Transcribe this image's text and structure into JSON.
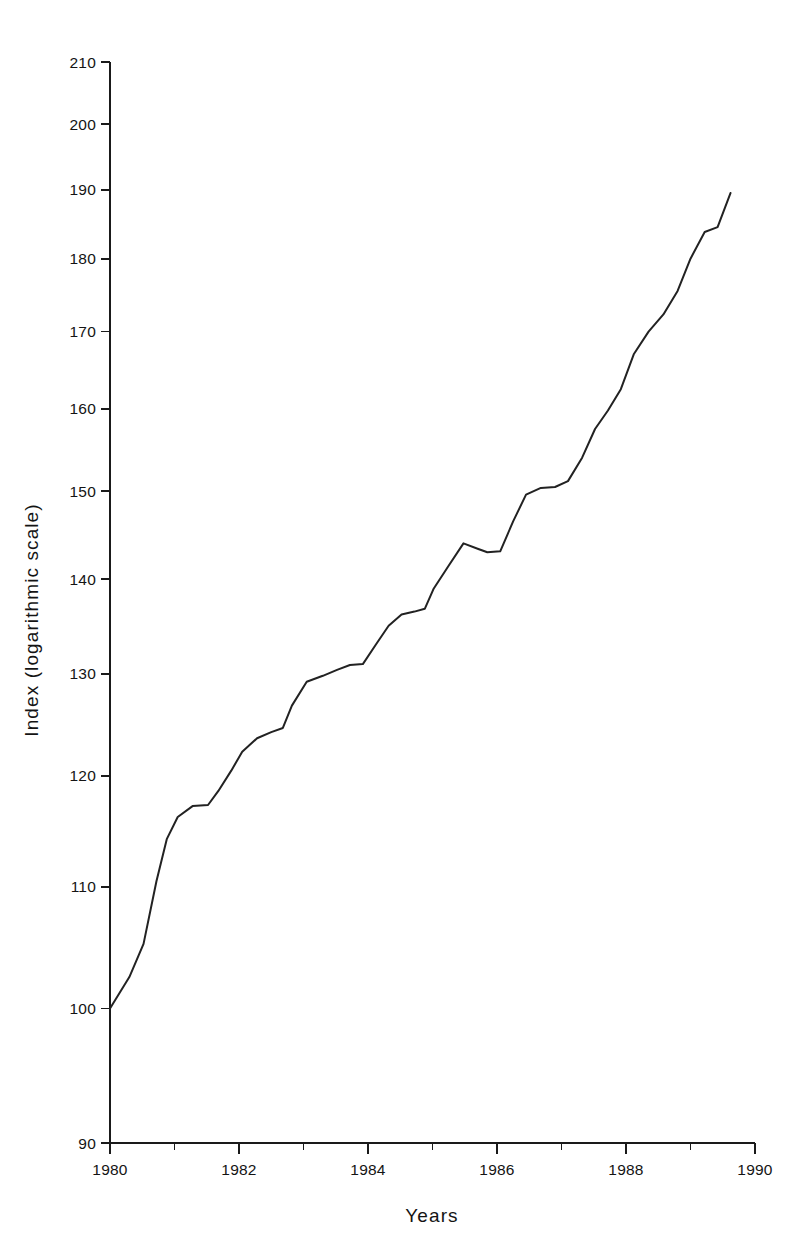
{
  "chart_data": {
    "type": "line",
    "title": "",
    "xlabel": "Years",
    "ylabel": "Index (logarithmic scale)",
    "yscale": "log",
    "xlim": [
      1980,
      1990
    ],
    "ylim": [
      90,
      210
    ],
    "grid": false,
    "legend": null,
    "y_ticks": [
      90,
      100,
      110,
      120,
      130,
      140,
      150,
      160,
      170,
      180,
      190,
      200,
      210
    ],
    "y_tick_labels": [
      "90",
      "100",
      "110",
      "120",
      "130",
      "140",
      "150",
      "160",
      "170",
      "180",
      "190",
      "200",
      "210"
    ],
    "x_ticks": [
      1980,
      1982,
      1984,
      1986,
      1988,
      1990
    ],
    "x_tick_labels": [
      "1980",
      "1982",
      "1984",
      "1986",
      "1988",
      "1990"
    ],
    "x_minor_ticks": [
      1981,
      1983,
      1985,
      1987,
      1989
    ],
    "series": [
      {
        "name": "Index",
        "color": "#222222",
        "x": [
          1980.0,
          1980.3,
          1980.52,
          1980.72,
          1980.88,
          1981.05,
          1981.28,
          1981.52,
          1981.68,
          1981.88,
          1982.05,
          1982.28,
          1982.5,
          1982.68,
          1982.82,
          1983.05,
          1983.3,
          1983.52,
          1983.72,
          1983.92,
          1984.12,
          1984.32,
          1984.52,
          1984.72,
          1984.88,
          1985.02,
          1985.25,
          1985.48,
          1985.7,
          1985.85,
          1986.05,
          1986.25,
          1986.45,
          1986.68,
          1986.9,
          1987.1,
          1987.32,
          1987.52,
          1987.72,
          1987.92,
          1988.12,
          1988.35,
          1988.58,
          1988.8,
          1989.0,
          1989.22,
          1989.42,
          1989.62
        ],
        "y": [
          100.0,
          102.5,
          105.2,
          110.5,
          114.2,
          116.2,
          117.2,
          117.3,
          118.6,
          120.5,
          122.3,
          123.6,
          124.2,
          124.6,
          126.8,
          129.2,
          129.8,
          130.4,
          130.9,
          131.0,
          133.0,
          135.0,
          136.2,
          136.5,
          136.8,
          139.0,
          141.5,
          144.0,
          143.4,
          143.0,
          143.1,
          146.5,
          149.6,
          150.4,
          150.5,
          151.2,
          154.0,
          157.5,
          159.8,
          162.5,
          167.0,
          170.0,
          172.3,
          175.5,
          180.0,
          183.8,
          184.5,
          189.5
        ]
      }
    ]
  },
  "axes": {
    "y_axis_title": "Index (logarithmic scale)",
    "x_axis_title": "Years"
  }
}
